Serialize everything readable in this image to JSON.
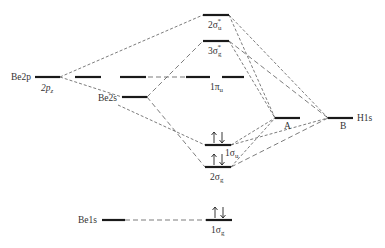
{
  "diagram": {
    "type": "molecular-orbital-diagram",
    "atomic_orbitals_left": [
      {
        "id": "be2p",
        "label": "Be2p",
        "sublabel": "2p_z"
      },
      {
        "id": "be2s",
        "label": "Be2s"
      },
      {
        "id": "be1s",
        "label": "Be1s"
      }
    ],
    "atomic_orbitals_right": [
      {
        "id": "A",
        "label": "A"
      },
      {
        "id": "B",
        "label": "B",
        "sublabel": "H1s"
      }
    ],
    "molecular_orbitals": [
      {
        "id": "2su",
        "label": "2σ",
        "sub": "u",
        "sup": "*",
        "electrons": 0
      },
      {
        "id": "3sg",
        "label": "3σ",
        "sub": "g",
        "sup": "*",
        "electrons": 0
      },
      {
        "id": "1pu",
        "label": "1π",
        "sub": "u",
        "electrons": 0
      },
      {
        "id": "1su",
        "label": "1σ",
        "sub": "u",
        "electrons": 2
      },
      {
        "id": "2sg",
        "label": "2σ",
        "sub": "g",
        "electrons": 2
      },
      {
        "id": "1sg",
        "label": "1σ",
        "sub": "g",
        "electrons": 2
      }
    ],
    "labels": {
      "be2p": "Be2p",
      "be2pz": "2p",
      "be2pz_sub": "z",
      "be2s": "Be2s",
      "be1s": "Be1s",
      "h1s": "H1s",
      "a": "A",
      "b": "B",
      "mo_2su": "2σ",
      "mo_2su_sub": "u",
      "mo_3sg": "3σ",
      "mo_3sg_sub": "g",
      "star": "*",
      "mo_1pu": "1π",
      "mo_1pu_sub": "u",
      "mo_1su": "1σ",
      "mo_1su_sub": "u",
      "mo_2sg": "2σ",
      "mo_2sg_sub": "g",
      "mo_1sg": "1σ",
      "mo_1sg_sub": "g"
    }
  }
}
